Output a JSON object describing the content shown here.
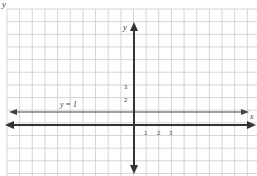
{
  "header_fragment": "y",
  "graph": {
    "x_axis_label": "x",
    "y_axis_label": "y",
    "line_label": "y = 1",
    "line_y_value": 1,
    "x_ticks": [
      "1",
      "2",
      "3"
    ],
    "y_ticks": [
      "2",
      "3"
    ],
    "colors": {
      "axis": "#333333",
      "grid": "#cccccc",
      "line": "#444444"
    }
  }
}
